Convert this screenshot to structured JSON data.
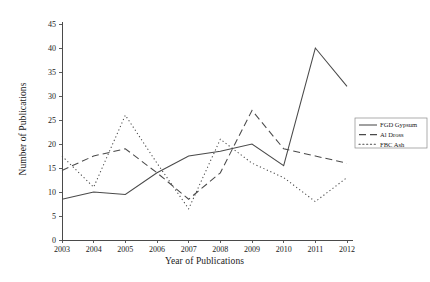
{
  "chart_data": {
    "type": "line",
    "title": "",
    "xlabel": "Year of Publications",
    "ylabel": "Number of Publications",
    "categories": [
      "2003",
      "2004",
      "2005",
      "2006",
      "2007",
      "2008",
      "2009",
      "2010",
      "2011",
      "2012"
    ],
    "ylim": [
      0,
      45
    ],
    "yticks": [
      0,
      5,
      10,
      15,
      20,
      25,
      30,
      35,
      40,
      45
    ],
    "grid": false,
    "legend_position": "right",
    "series": [
      {
        "name": "FGD Gypsum",
        "style": "solid",
        "color": "#4a4a4a",
        "values": [
          8.5,
          10,
          9.5,
          14,
          17.5,
          18.5,
          20,
          15.5,
          40,
          32
        ]
      },
      {
        "name": "Al Dross",
        "style": "dashed",
        "color": "#4a4a4a",
        "values": [
          14.5,
          17.5,
          19,
          14,
          8.5,
          14,
          27,
          19,
          17.5,
          16
        ]
      },
      {
        "name": "FBC Ash",
        "style": "dotted",
        "color": "#4a4a4a",
        "values": [
          17.5,
          11,
          26,
          16,
          6.5,
          21,
          16,
          13,
          8,
          13
        ]
      }
    ]
  },
  "axes": {
    "y_tick_labels": [
      "0",
      "5",
      "10",
      "15",
      "20",
      "25",
      "30",
      "35",
      "40",
      "45"
    ],
    "x_tick_labels": [
      "2003",
      "2004",
      "2005",
      "2006",
      "2007",
      "2008",
      "2009",
      "2010",
      "2011",
      "2012"
    ],
    "xlabel": "Year of Publications",
    "ylabel": "Number of Publications"
  },
  "legend": {
    "entries": [
      {
        "label": "FGD Gypsum",
        "style": "solid"
      },
      {
        "label": "Al Dross",
        "style": "dashed"
      },
      {
        "label": "FBC Ash",
        "style": "dotted"
      }
    ]
  }
}
